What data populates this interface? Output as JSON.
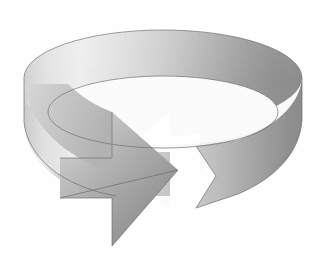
{
  "image": {
    "title": "Circular Arrow Ring",
    "description": "Grayscale 3D perspective drawing of a cylindrical band (ring) forming a clockwise circular arrow, with an arrowhead at the lower left front and a notched ribbon tail at the lower right.",
    "style": "halftone-grain-grayscale-clipart",
    "background_color": "#ffffff",
    "canvas": {
      "width": 327,
      "height": 258
    }
  },
  "palette": {
    "background": "#ffffff",
    "highlight": "#f4f4f4",
    "light_gray": "#dcdcdc",
    "mid_gray": "#b4b4b4",
    "dark_gray": "#8a8a8a",
    "shadow_gray": "#6f6f6f",
    "outline": "#5a5a5a"
  },
  "geometry": {
    "ellipse_center_x": 163,
    "ellipse_top_y": 30,
    "ellipse_rx": 139,
    "ellipse_ry": 48,
    "band_height": 92,
    "arrow_tip_x": 176,
    "arrow_tip_y": 168,
    "tail_notch_x": 200,
    "tail_notch_y": 196
  },
  "parts": [
    {
      "name": "back-band-top-rim",
      "shade": "light-to-dark-left-to-right"
    },
    {
      "name": "ring-inner-opening",
      "shade": "white"
    },
    {
      "name": "front-band-left",
      "shade": "light"
    },
    {
      "name": "arrow-head",
      "shade": "mid-to-dark"
    },
    {
      "name": "ribbon-tail-notch",
      "shade": "mid"
    },
    {
      "name": "front-band-right",
      "shade": "dark"
    }
  ]
}
